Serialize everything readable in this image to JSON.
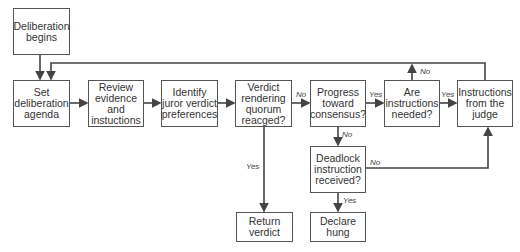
{
  "diagram": {
    "nodes": {
      "start": "Deliberation\nbegins",
      "agenda": "Set\ndeliberation\nagenda",
      "review": "Review\nevidence\nand\ninstuctions",
      "identify": "Identify\njuror verdict\npreferences",
      "quorum": "Verdict\nrendering\nquorum\nreacged?",
      "progress": "Progress\ntoward\nconsensus?",
      "needed": "Are\ninstructions\nneeded?",
      "judge": "Instructions\nfrom the\njudge",
      "deadlock": "Deadlock\ninstruction\nreceived?",
      "return": "Return\nverdict",
      "hung": "Declare\nhung"
    },
    "edge_labels": {
      "quorum_no": "No",
      "quorum_yes": "Yes",
      "progress_yes": "Yes",
      "progress_no": "No",
      "needed_yes": "Yes",
      "needed_no": "No",
      "deadlock_no": "No",
      "deadlock_yes": "Yes"
    },
    "colors": {
      "line": "#444444",
      "border": "#555555",
      "text": "#333333"
    }
  }
}
